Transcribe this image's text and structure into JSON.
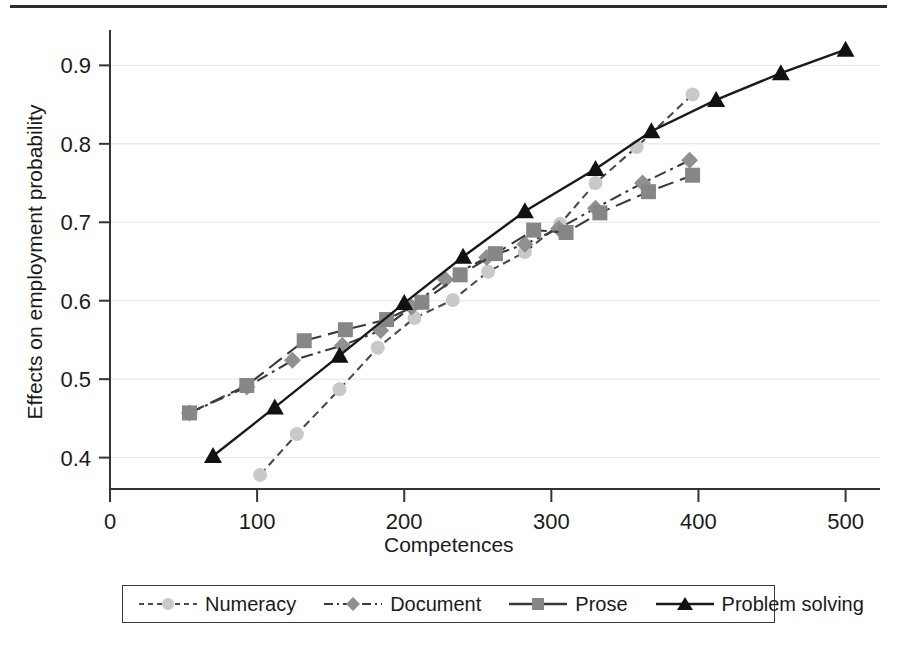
{
  "chart_data": {
    "type": "line",
    "title": "",
    "xlabel": "Competences",
    "ylabel": "Effects on employment probability",
    "xlim": [
      0,
      520
    ],
    "ylim": [
      0.36,
      0.94
    ],
    "xticks": [
      "0",
      "100",
      "200",
      "300",
      "400",
      "500"
    ],
    "xtick_values": [
      0,
      100,
      200,
      300,
      400,
      500
    ],
    "yticks": [
      "0.4",
      "0.5",
      "0.6",
      "0.7",
      "0.8",
      "0.9"
    ],
    "ytick_values": [
      0.4,
      0.5,
      0.6,
      0.7,
      0.8,
      0.9
    ],
    "grid": "horizontal",
    "legend_position": "below-axis",
    "series": [
      {
        "name": "Numeracy",
        "marker": "circle",
        "color": "#c9c9c9",
        "line_color": "#4a4a4a",
        "dash": "dashed",
        "x": [
          102,
          127,
          156,
          182,
          207,
          233,
          257,
          282,
          306,
          330,
          358,
          396
        ],
        "y": [
          0.378,
          0.43,
          0.487,
          0.54,
          0.578,
          0.601,
          0.637,
          0.662,
          0.698,
          0.75,
          0.796,
          0.863
        ]
      },
      {
        "name": "Document",
        "marker": "diamond",
        "color": "#909090",
        "line_color": "#3a3a3a",
        "dash": "dash-dot",
        "x": [
          54,
          93,
          124,
          158,
          184,
          205,
          228,
          256,
          282,
          305,
          330,
          362,
          394
        ],
        "y": [
          0.457,
          0.49,
          0.524,
          0.543,
          0.562,
          0.592,
          0.627,
          0.655,
          0.672,
          0.692,
          0.718,
          0.75,
          0.779
        ]
      },
      {
        "name": "Prose",
        "marker": "square",
        "color": "#868686",
        "line_color": "#3a3a3a",
        "dash": "long-dash",
        "x": [
          54,
          93,
          132,
          160,
          188,
          212,
          238,
          262,
          288,
          310,
          333,
          366,
          396
        ],
        "y": [
          0.457,
          0.492,
          0.549,
          0.563,
          0.576,
          0.598,
          0.633,
          0.66,
          0.69,
          0.687,
          0.712,
          0.739,
          0.76
        ]
      },
      {
        "name": "Problem solving",
        "marker": "triangle",
        "color": "#111111",
        "line_color": "#1a1a1a",
        "dash": "solid",
        "x": [
          70,
          112,
          156,
          200,
          240,
          282,
          330,
          368,
          412,
          456,
          500
        ],
        "y": [
          0.402,
          0.464,
          0.53,
          0.597,
          0.656,
          0.714,
          0.768,
          0.816,
          0.856,
          0.89,
          0.92
        ]
      }
    ]
  },
  "legend": {
    "entries": [
      {
        "label": "Numeracy"
      },
      {
        "label": "Document"
      },
      {
        "label": "Prose"
      },
      {
        "label": "Problem solving"
      }
    ]
  }
}
